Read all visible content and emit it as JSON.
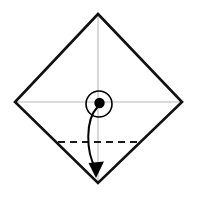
{
  "figure": {
    "title": "Origami fold step diagram",
    "canvas": {
      "width": 197,
      "height": 197,
      "background": "#ffffff"
    },
    "colors": {
      "outline": "#111111",
      "crease_guide": "#b9b9b9",
      "fold_line": "#1a1a1a",
      "arrow": "#000000",
      "marker_fill": "#000000",
      "marker_stroke": "#000000",
      "background": "#ffffff"
    },
    "shapes": {
      "sheet": {
        "name": "square-sheet-diamond",
        "kind": "polygon",
        "points": "98,14 182,102 98,183 15,102",
        "stroke_width": 2.6,
        "fill": "none"
      },
      "guides": [
        {
          "name": "vertical-center-guide",
          "kind": "line",
          "x1": 98,
          "y1": 14,
          "x2": 98,
          "y2": 183,
          "stroke_width": 1.1
        },
        {
          "name": "horizontal-center-guide",
          "kind": "line",
          "x1": 15,
          "y1": 102,
          "x2": 182,
          "y2": 102,
          "stroke_width": 1.1
        }
      ],
      "center_marker": {
        "name": "center-point-marker",
        "circle": {
          "cx": 99,
          "cy": 104,
          "r": 13,
          "stroke_width": 1.6,
          "fill": "none"
        },
        "dot": {
          "cx": 99.5,
          "cy": 103,
          "r": 5.2
        }
      },
      "fold_line": {
        "name": "horizontal-dashed-fold-line",
        "kind": "dashed-line",
        "x1": 58,
        "y1": 142,
        "x2": 139,
        "y2": 142,
        "stroke_width": 1.9,
        "dash_pattern": "7,5"
      },
      "fold_arrow": {
        "name": "curved-fold-arrow",
        "kind": "curved-arrow",
        "path": "M 97.5,107 C 85,120 86,152 95.5,168",
        "stroke_width": 2.0,
        "head": {
          "points": "88.5,163 104,161.5 96,178",
          "fill": "#000000"
        }
      }
    }
  }
}
